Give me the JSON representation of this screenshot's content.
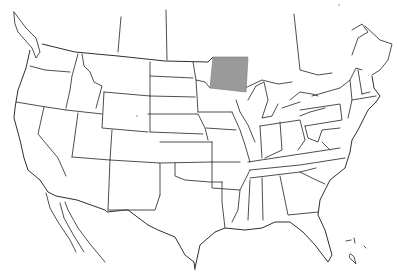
{
  "map": {
    "type": "outline-map",
    "region": "United States (contiguous) with Canada borders, Mexico, Hawaii",
    "highlight": {
      "label": "highlighted-region",
      "color": "#9a9a9a",
      "polygon": [
        [
          213,
          57
        ],
        [
          248,
          57
        ],
        [
          246,
          92
        ],
        [
          210,
          88
        ]
      ]
    },
    "line_color": "#3a3a3a",
    "background": "#ffffff",
    "islands": "Hawaii (bottom right)"
  }
}
